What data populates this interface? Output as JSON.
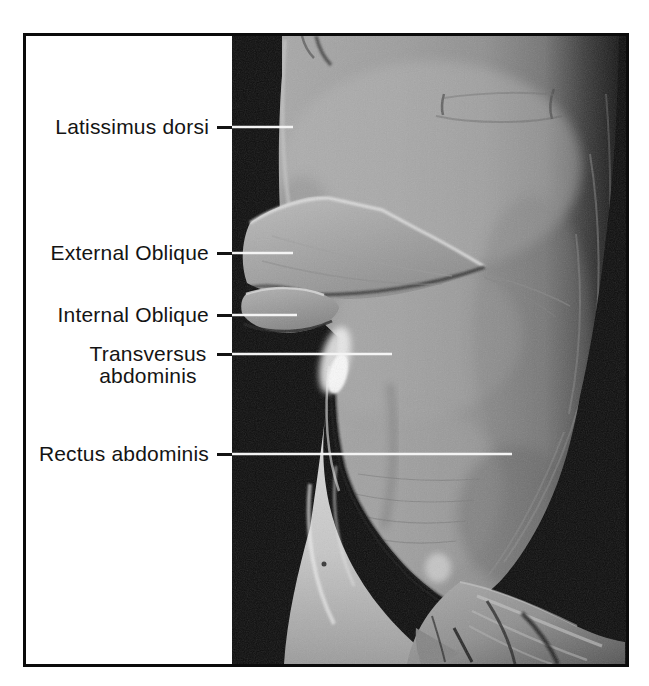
{
  "figure": {
    "labels": [
      {
        "text": "Latissimus dorsi"
      },
      {
        "text": "External Oblique"
      },
      {
        "text": "Internal Oblique"
      },
      {
        "text": "Transversus abdominis"
      },
      {
        "text": "Rectus abdominis"
      }
    ],
    "colors": {
      "page_background": "#ffffff",
      "frame_border": "#0b0b0b",
      "label_panel_background": "#ffffff",
      "label_text": "#141414",
      "photo_background": "#0d0d0d",
      "leader_dash": "#141414",
      "leader_line": "#f4f4f4"
    }
  }
}
